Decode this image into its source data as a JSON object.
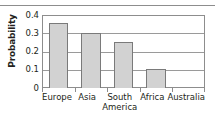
{
  "chart_data": {
    "type": "bar",
    "title": "",
    "xlabel": "",
    "ylabel": "Probability",
    "categories": [
      "Europe",
      "Asia",
      "South America",
      "Africa",
      "Australia"
    ],
    "category_lines": [
      [
        "Europe"
      ],
      [
        "Asia"
      ],
      [
        "South",
        "America"
      ],
      [
        "Africa"
      ],
      [
        "Australia"
      ]
    ],
    "values": [
      0.355,
      0.3,
      0.25,
      0.105,
      0
    ],
    "ylim": [
      0,
      0.4
    ],
    "yticks": [
      "0",
      "0.1",
      "0.2",
      "0.3",
      "0.4"
    ],
    "ytick_values": [
      0,
      0.1,
      0.2,
      0.3,
      0.4
    ],
    "grid": true,
    "legend": false,
    "colors": {
      "bar_fill": "#d2d2d2",
      "bar_border": "#7a7a7a",
      "axis": "#8d8d8d",
      "grid": "#9a9a9a",
      "text": "#231f20",
      "background": "#ffffff"
    }
  }
}
